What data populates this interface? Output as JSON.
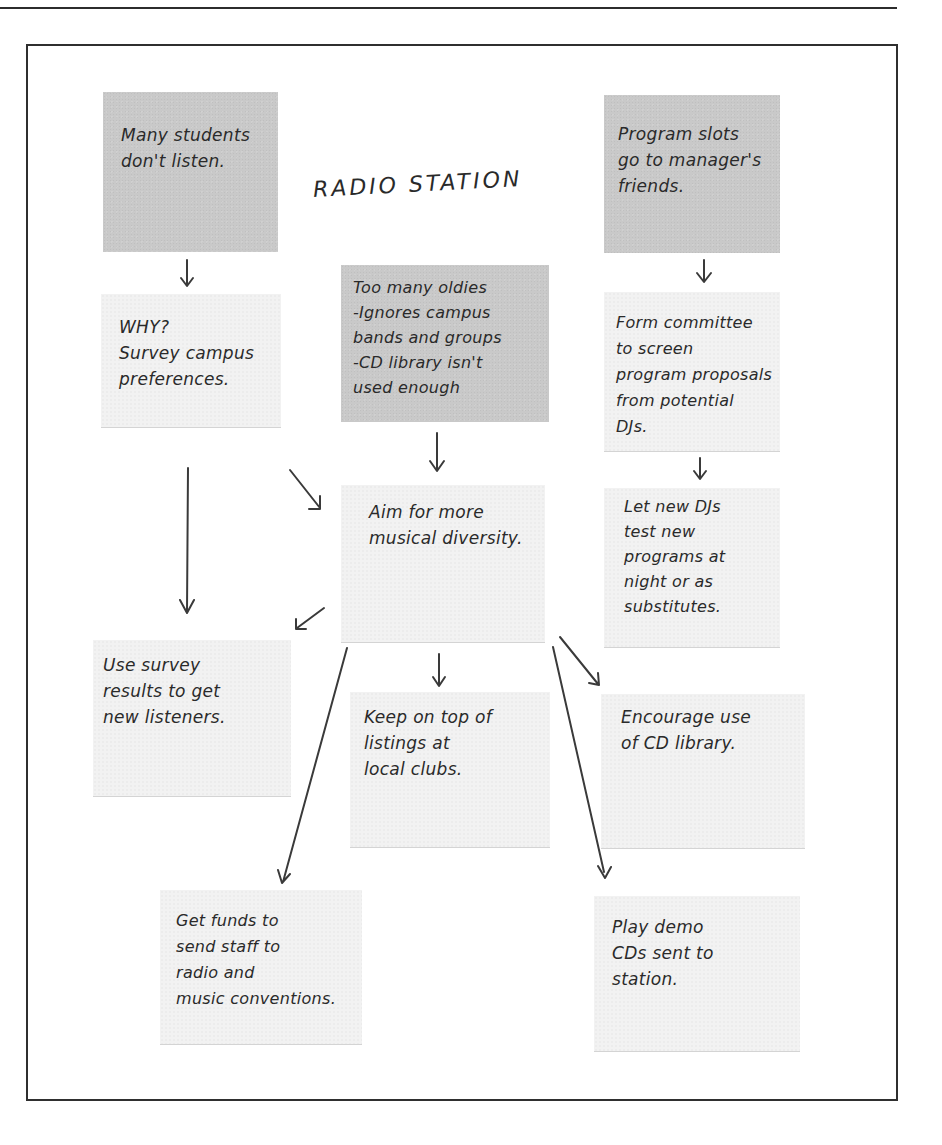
{
  "diagram": {
    "title": "RADIO STATION",
    "notes": {
      "problem_students": {
        "text": "Many students\ndon't listen.",
        "shade": "dark"
      },
      "problem_slots": {
        "text": "Program slots\ngo to manager's\nfriends.",
        "shade": "dark"
      },
      "problem_oldies": {
        "text": "Too many oldies\n-Ignores campus\nbands and groups\n-CD library isn't\nused enough",
        "shade": "dark"
      },
      "why_survey": {
        "text": "WHY?\nSurvey campus\npreferences.",
        "shade": "light"
      },
      "form_committee": {
        "text": "Form committee\nto screen\nprogram proposals\nfrom potential\nDJs.",
        "shade": "light"
      },
      "aim_diversity": {
        "text": "Aim for more\nmusical diversity.",
        "shade": "light"
      },
      "let_new_djs": {
        "text": "Let new DJs\ntest new\nprograms at\nnight or as\nsubstitutes.",
        "shade": "light"
      },
      "use_survey": {
        "text": "Use survey\nresults to get\nnew listeners.",
        "shade": "light"
      },
      "keep_listings": {
        "text": "Keep on top of\nlistings at\nlocal clubs.",
        "shade": "light"
      },
      "encourage_cd": {
        "text": "Encourage use\nof CD library.",
        "shade": "light"
      },
      "get_funds": {
        "text": "Get funds to\nsend staff to\nradio and\nmusic conventions.",
        "shade": "light"
      },
      "play_demo": {
        "text": "Play demo\nCDs sent to\nstation.",
        "shade": "light"
      }
    },
    "connections": [
      {
        "from": "problem_students",
        "to": "why_survey"
      },
      {
        "from": "problem_slots",
        "to": "form_committee"
      },
      {
        "from": "problem_oldies",
        "to": "aim_diversity"
      },
      {
        "from": "why_survey",
        "to": "aim_diversity"
      },
      {
        "from": "why_survey",
        "to": "use_survey"
      },
      {
        "from": "form_committee",
        "to": "let_new_djs"
      },
      {
        "from": "aim_diversity",
        "to": "use_survey"
      },
      {
        "from": "aim_diversity",
        "to": "keep_listings"
      },
      {
        "from": "aim_diversity",
        "to": "encourage_cd"
      },
      {
        "from": "aim_diversity",
        "to": "get_funds"
      },
      {
        "from": "aim_diversity",
        "to": "play_demo"
      }
    ],
    "colors": {
      "problem_note": "#c9c9c9",
      "solution_note": "#f2f2f2",
      "ink": "#2a2a2a",
      "frame": "#2f2f2f"
    }
  }
}
